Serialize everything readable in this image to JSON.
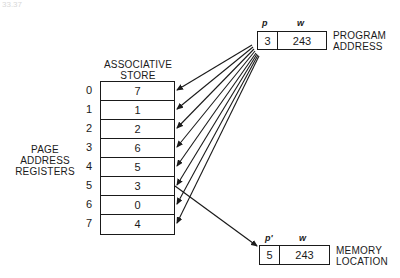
{
  "corner_fragment": "33.37",
  "associative_store": {
    "title_line1": "ASSOCIATIVE",
    "title_line2": "STORE",
    "indices": [
      "0",
      "1",
      "2",
      "3",
      "4",
      "5",
      "6",
      "7"
    ],
    "values": [
      "7",
      "1",
      "2",
      "6",
      "5",
      "3",
      "0",
      "4"
    ]
  },
  "side_label": {
    "line1": "PAGE",
    "line2": "ADDRESS",
    "line3": "REGISTERS"
  },
  "program_address": {
    "p_label": "p",
    "w_label": "w",
    "p_value": "3",
    "w_value": "243",
    "caption_line1": "PROGRAM",
    "caption_line2": "ADDRESS"
  },
  "memory_location": {
    "p_label": "p'",
    "w_label": "w",
    "p_value": "5",
    "w_value": "243",
    "caption_line1": "MEMORY",
    "caption_line2": "LOCATION"
  },
  "colors": {
    "ink": "#1a1a1a",
    "background": "#ffffff"
  }
}
